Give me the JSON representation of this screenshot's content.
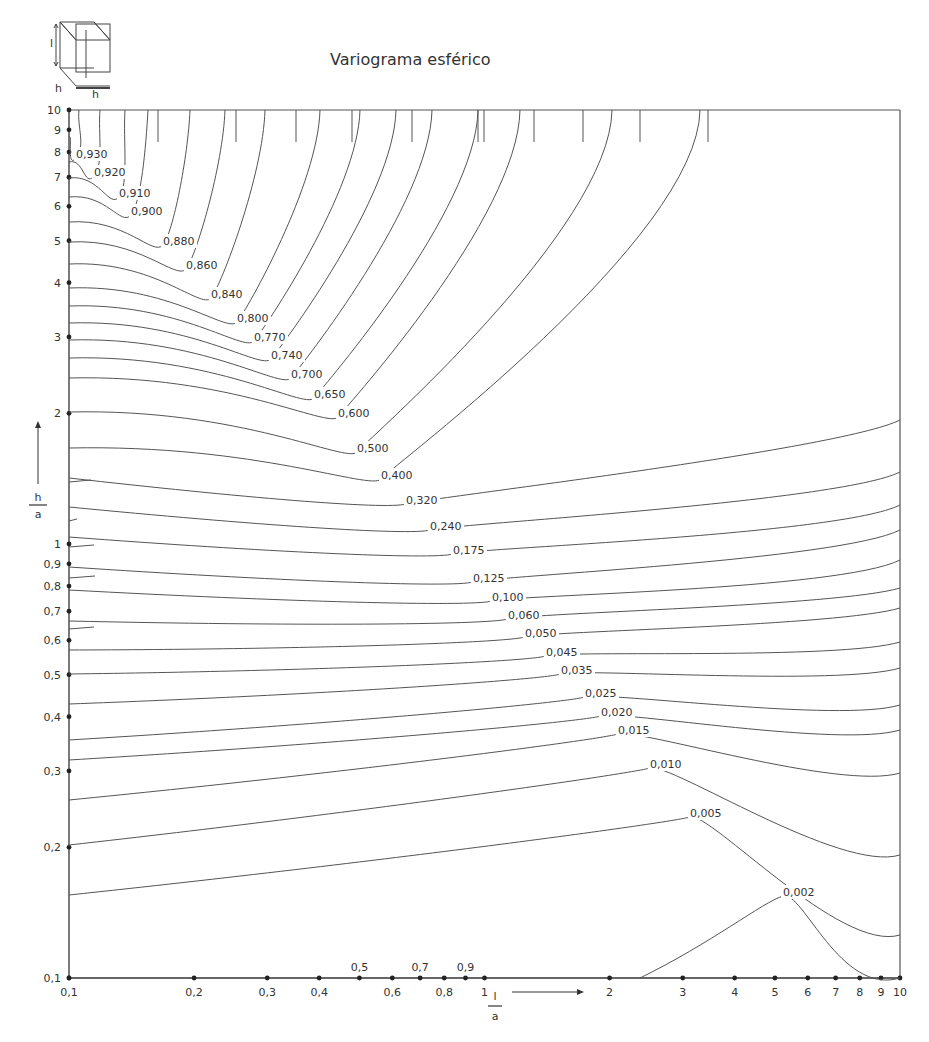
{
  "page": {
    "title": "Variograma esférico",
    "inset": {
      "label_vertical": "l",
      "label_depth": "h",
      "label_width": "h"
    }
  },
  "chart_data": {
    "type": "contour",
    "title": "Variograma esférico",
    "xlabel": "l / a",
    "ylabel": "h / a",
    "xscale": "log",
    "yscale": "log",
    "xlim": [
      0.1,
      10
    ],
    "ylim": [
      0.1,
      10
    ],
    "grid": false,
    "x_ticks": [
      0.1,
      0.2,
      0.3,
      0.4,
      0.5,
      0.6,
      0.7,
      0.8,
      0.9,
      1,
      2,
      3,
      4,
      5,
      6,
      7,
      8,
      9,
      10
    ],
    "x_tick_labels_below": [
      "0,1",
      "0,2",
      "0,3",
      "0,4",
      "0,6",
      "0,8",
      "1",
      "2",
      "3",
      "4",
      "5",
      "6",
      "7",
      "8",
      "9",
      "10"
    ],
    "x_tick_labels_below_values": [
      0.1,
      0.2,
      0.3,
      0.4,
      0.6,
      0.8,
      1,
      2,
      3,
      4,
      5,
      6,
      7,
      8,
      9,
      10
    ],
    "x_tick_labels_above": [
      "0,5",
      "0,7",
      "0,9"
    ],
    "x_tick_labels_above_values": [
      0.5,
      0.7,
      0.9
    ],
    "y_ticks": [
      0.1,
      0.2,
      0.3,
      0.4,
      0.5,
      0.6,
      0.7,
      0.8,
      0.9,
      1,
      2,
      3,
      4,
      5,
      6,
      7,
      8,
      9,
      10
    ],
    "y_tick_labels": [
      "0,1",
      "0,2",
      "0,3",
      "0,4",
      "0,5",
      "0,6",
      "0,7",
      "0,8",
      "0,9",
      "1",
      "2",
      "3",
      "4",
      "5",
      "6",
      "7",
      "8",
      "9",
      "10"
    ],
    "contour_levels": [
      0.93,
      0.92,
      0.91,
      0.9,
      0.88,
      0.86,
      0.84,
      0.8,
      0.77,
      0.74,
      0.7,
      0.65,
      0.6,
      0.5,
      0.4,
      0.32,
      0.24,
      0.175,
      0.125,
      0.1,
      0.06,
      0.05,
      0.045,
      0.035,
      0.025,
      0.02,
      0.015,
      0.01,
      0.005,
      0.002
    ],
    "contour_labels": [
      "0,930",
      "0,920",
      "0,910",
      "0,900",
      "0,880",
      "0,860",
      "0,840",
      "0,800",
      "0,770",
      "0,740",
      "0,700",
      "0,650",
      "0,600",
      "0,500",
      "0,400",
      "0,320",
      "0,240",
      "0,175",
      "0,125",
      "0,100",
      "0,060",
      "0,050",
      "0,045",
      "0,035",
      "0,025",
      "0,020",
      "0,015",
      "0,010",
      "0,005",
      "0,002"
    ],
    "label_positions_px": [
      [
        76,
        158
      ],
      [
        94,
        176
      ],
      [
        119,
        197
      ],
      [
        131,
        215
      ],
      [
        163,
        245
      ],
      [
        186,
        269
      ],
      [
        211,
        298
      ],
      [
        237,
        322
      ],
      [
        254,
        341
      ],
      [
        271,
        359
      ],
      [
        291,
        378
      ],
      [
        314,
        398
      ],
      [
        338,
        417
      ],
      [
        357,
        452
      ],
      [
        381,
        479
      ],
      [
        406,
        504
      ],
      [
        430,
        530
      ],
      [
        453,
        554
      ],
      [
        473,
        582
      ],
      [
        492,
        601
      ],
      [
        508,
        619
      ],
      [
        525,
        637
      ],
      [
        546,
        656
      ],
      [
        561,
        674
      ],
      [
        585,
        697
      ],
      [
        601,
        716
      ],
      [
        618,
        734
      ],
      [
        650,
        768
      ],
      [
        690,
        817
      ],
      [
        783,
        896
      ]
    ]
  }
}
